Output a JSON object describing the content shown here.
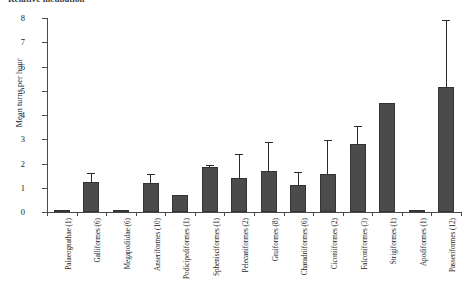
{
  "figure": {
    "clipped_header": "Relative incubation"
  },
  "chart_data": {
    "type": "bar",
    "title": "",
    "xlabel": "",
    "ylabel": "Mean turns per hour",
    "ylim": [
      0,
      8
    ],
    "yticks": [
      0,
      1,
      2,
      3,
      4,
      5,
      6,
      7,
      8
    ],
    "grid": false,
    "legend": null,
    "bar_color": "#4b4b4b",
    "error_bar_type": "upper-only",
    "categories": [
      "Palaeognathae (1)",
      "Galliformes (6)",
      "Megapodiidae (6)",
      "Anseriformes (10)",
      "Podicipediformes (1)",
      "Sphenisciformes (1)",
      "Pelecaniformes (2)",
      "Gruiformes (8)",
      "Charadriiformes (6)",
      "Ciconiiformes (2)",
      "Falconiformes (3)",
      "Strigiformes (1)",
      "Apodiformes (1)",
      "Passeriformes (12)"
    ],
    "values": [
      0.03,
      1.25,
      0.03,
      1.18,
      0.72,
      1.85,
      1.42,
      1.7,
      1.12,
      1.55,
      2.8,
      4.5,
      0.03,
      5.15
    ],
    "errors_upper": [
      0,
      1.62,
      0,
      1.55,
      0,
      1.92,
      2.38,
      2.9,
      1.65,
      2.98,
      3.55,
      0,
      0,
      7.9
    ]
  }
}
